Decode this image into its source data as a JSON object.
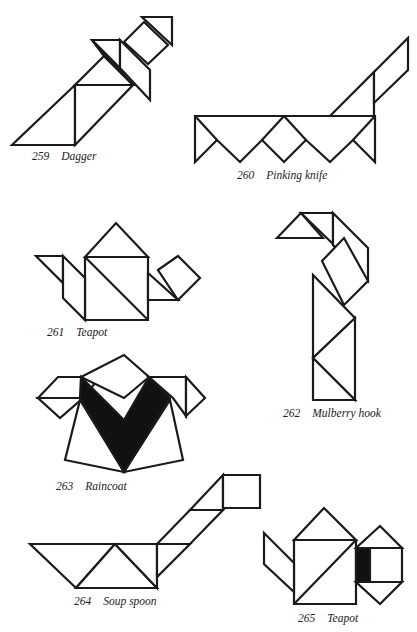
{
  "page": {
    "background": "#ffffff",
    "ink": "#1a1a1a"
  },
  "figures": [
    {
      "number": "259",
      "title": "Dagger"
    },
    {
      "number": "260",
      "title": "Pinking knife"
    },
    {
      "number": "261",
      "title": "Teapot"
    },
    {
      "number": "262",
      "title": "Mulberry hook"
    },
    {
      "number": "263",
      "title": "Raincoat"
    },
    {
      "number": "264",
      "title": "Soup spoon"
    },
    {
      "number": "265",
      "title": "Teapot"
    }
  ]
}
